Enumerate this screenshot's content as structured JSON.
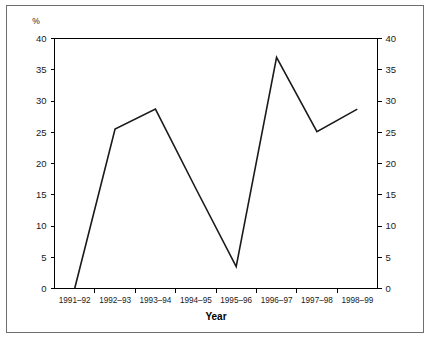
{
  "chart_data": {
    "type": "line",
    "title": "",
    "subtitle": "",
    "xlabel": "Year",
    "ylabel": "%",
    "unit_label": "%",
    "categories": [
      "1991–92",
      "1992–93",
      "1993–94",
      "1994–95",
      "1995–96",
      "1996–97",
      "1997–98",
      "1998–99"
    ],
    "values": [
      0,
      25.5,
      28.7,
      16.0,
      3.5,
      37.0,
      25.1,
      28.7
    ],
    "series": [
      {
        "name": "",
        "values": [
          0,
          25.5,
          28.7,
          16.0,
          3.5,
          37.0,
          25.1,
          28.7
        ]
      }
    ],
    "ylim": [
      0,
      40
    ],
    "ytick_values": [
      0,
      5,
      10,
      15,
      20,
      25,
      30,
      35,
      40
    ],
    "ytick_labels_left": [
      "0",
      "5",
      "10",
      "15",
      "20",
      "25",
      "30",
      "35",
      "40"
    ],
    "ytick_labels_right": [
      "0",
      "5",
      "10",
      "15",
      "20",
      "25",
      "30",
      "35",
      "40"
    ],
    "grid": false,
    "legend": false,
    "legend_position": "none",
    "dual_axis": true,
    "line_color": "#1a1a1a",
    "axis_color": "#000000",
    "frame_color": "#6e6e6e",
    "background_color": "#ffffff"
  },
  "figure": {
    "unit_top_left": "%",
    "x_axis_title": "Year",
    "right_axis_top": "40",
    "right_axis_bottom": "0"
  }
}
